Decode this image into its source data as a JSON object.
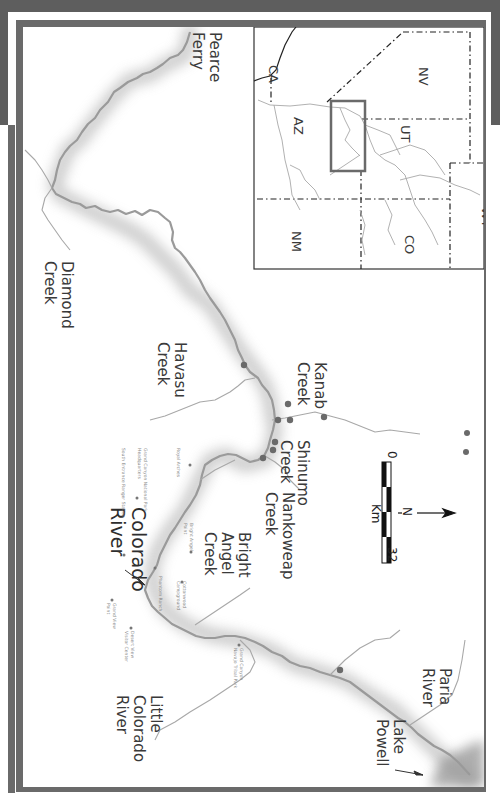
{
  "map": {
    "orientation": "rotated 90 degrees clockwise",
    "colors": {
      "frame": "#6a6a6a",
      "background_band": "#5e5e5e",
      "river": "#9a9a9a",
      "points": "#6a6a6a",
      "land": "#ffffff"
    },
    "labels": {
      "pearce_ferry": "Pearce\nFerry",
      "diamond_creek": "Diamond\nCreek",
      "havasu_creek": "Havasu\nCreek",
      "kanab_creek": "Kanab\nCreek",
      "shinumo_creek": "Shinumo\nCreek",
      "nankoweap_creek": "Nankoweap\nCreek",
      "bright_angel_creek": "Bright\nAngel\nCreek",
      "colorado_river": "Colorado\nRiver",
      "little_colorado_river": "Little\nColorado\nRiver",
      "paria_river": "Paria\nRiver",
      "lake_powell": "Lake\nPowell"
    },
    "places": {
      "royal_arches": "Royal Arches",
      "gcnp_hq": "Grand Canyon National Park\nHeadquarters",
      "south_entrance": "South Entrance Ranger Station",
      "bright_angel_point": "Bright Angel\nPoint",
      "cottonwood": "Cottonwood\nCampground",
      "phantom_ranch": "Phantom Ranch",
      "grand_view_point": "Grand View\nPoint",
      "desert_view": "Desert View\nVisitor Center",
      "navajo_park": "Grand Canyon\nNavajo Tribal Park"
    },
    "scale_bar": {
      "start": "0",
      "end": "32",
      "unit": "Km"
    },
    "north_arrow": {
      "label": "N"
    },
    "inset": {
      "states": [
        "CA",
        "NV",
        "AZ",
        "UT",
        "NM",
        "CO",
        "WY"
      ]
    }
  }
}
